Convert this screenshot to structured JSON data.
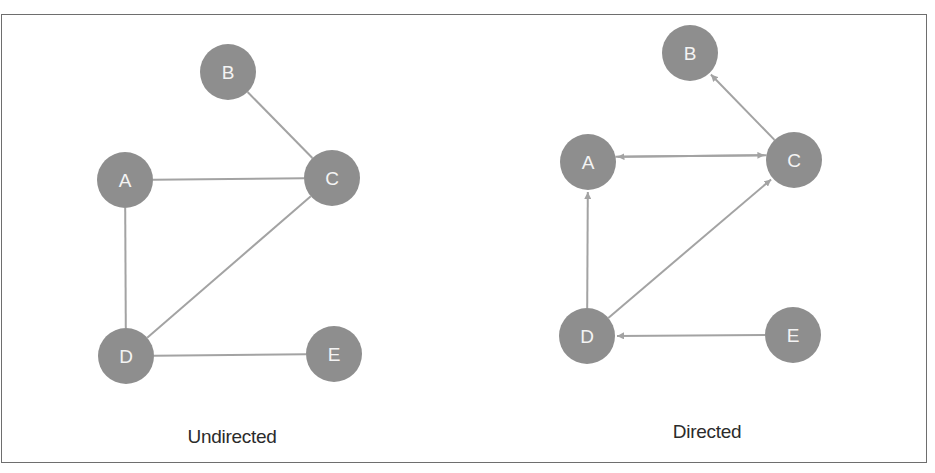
{
  "figure": {
    "panels": [
      {
        "id": "undirected",
        "caption": "Undirected",
        "caption_pos": [
          232,
          443
        ],
        "directed": false,
        "nodes": [
          {
            "id": "A",
            "label": "A",
            "x": 125,
            "y": 180
          },
          {
            "id": "B",
            "label": "B",
            "x": 228,
            "y": 72
          },
          {
            "id": "C",
            "label": "C",
            "x": 332,
            "y": 178
          },
          {
            "id": "D",
            "label": "D",
            "x": 126,
            "y": 356
          },
          {
            "id": "E",
            "label": "E",
            "x": 334,
            "y": 354
          }
        ],
        "edges": [
          {
            "from": "B",
            "to": "C"
          },
          {
            "from": "A",
            "to": "C"
          },
          {
            "from": "A",
            "to": "D"
          },
          {
            "from": "D",
            "to": "C"
          },
          {
            "from": "D",
            "to": "E"
          }
        ]
      },
      {
        "id": "directed",
        "caption": "Directed",
        "caption_pos": [
          707,
          438
        ],
        "directed": true,
        "nodes": [
          {
            "id": "A",
            "label": "A",
            "x": 588,
            "y": 162
          },
          {
            "id": "B",
            "label": "B",
            "x": 690,
            "y": 53
          },
          {
            "id": "C",
            "label": "C",
            "x": 794,
            "y": 160
          },
          {
            "id": "D",
            "label": "D",
            "x": 587,
            "y": 336
          },
          {
            "id": "E",
            "label": "E",
            "x": 793,
            "y": 335
          }
        ],
        "edges": [
          {
            "from": "C",
            "to": "B"
          },
          {
            "from": "A",
            "to": "C",
            "offset": -5
          },
          {
            "from": "C",
            "to": "A",
            "offset": 5
          },
          {
            "from": "D",
            "to": "A"
          },
          {
            "from": "D",
            "to": "C"
          },
          {
            "from": "E",
            "to": "D"
          }
        ]
      }
    ]
  },
  "style": {
    "node_fill": "#8e8e8e",
    "node_radius": 28,
    "edge_color": "#a3a3a3",
    "label_color": "#f4f4f4",
    "caption_color": "#2b2b2b",
    "frame_color": "#6e6e6e"
  }
}
